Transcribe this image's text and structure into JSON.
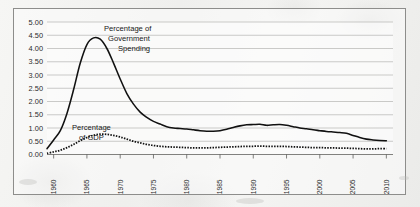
{
  "chart_data": {
    "type": "line",
    "title": "",
    "subtitle": "",
    "xlabel": "",
    "ylabel": "",
    "xlim": [
      1959,
      2011
    ],
    "ylim": [
      0.0,
      5.0
    ],
    "grid": true,
    "legend_position": "inline-annotations",
    "y_ticks": [
      "5.00",
      "4.50",
      "4.00",
      "3.50",
      "3.00",
      "2.50",
      "2.00",
      "1.50",
      "1.00",
      "0.50",
      "0.00"
    ],
    "y_tick_values": [
      5.0,
      4.5,
      4.0,
      3.5,
      3.0,
      2.5,
      2.0,
      1.5,
      1.0,
      0.5,
      0.0
    ],
    "x_ticks": [
      "1960",
      "1965",
      "1970",
      "1975",
      "1980",
      "1985",
      "1990",
      "1995",
      "2000",
      "2005",
      "2010"
    ],
    "x_tick_values": [
      1960,
      1965,
      1970,
      1975,
      1980,
      1985,
      1990,
      1995,
      2000,
      2005,
      2010
    ],
    "annotations": [
      {
        "text": "Percentage of\nGovernment\nSpending",
        "lines": [
          "Percentage of",
          "Government",
          "Spending"
        ],
        "series": "Percentage of Government Spending"
      },
      {
        "text": "Percentage\nof GDP",
        "lines": [
          "Percentage",
          "of GDP"
        ],
        "series": "Percentage of GDP"
      }
    ],
    "series": [
      {
        "name": "Percentage of Government Spending",
        "style": "solid",
        "color": "#111111",
        "x": [
          1959,
          1960,
          1961,
          1962,
          1963,
          1964,
          1965,
          1966,
          1967,
          1968,
          1969,
          1970,
          1971,
          1972,
          1973,
          1974,
          1975,
          1976,
          1977,
          1978,
          1979,
          1980,
          1981,
          1982,
          1983,
          1984,
          1985,
          1986,
          1987,
          1988,
          1989,
          1990,
          1991,
          1992,
          1993,
          1994,
          1995,
          1996,
          1997,
          1998,
          1999,
          2000,
          2001,
          2002,
          2003,
          2004,
          2005,
          2006,
          2007,
          2008,
          2009,
          2010
        ],
        "values": [
          0.22,
          0.55,
          0.9,
          1.55,
          2.45,
          3.45,
          4.15,
          4.4,
          4.35,
          4.0,
          3.45,
          2.85,
          2.3,
          1.9,
          1.6,
          1.4,
          1.25,
          1.15,
          1.05,
          1.0,
          0.98,
          0.96,
          0.93,
          0.9,
          0.88,
          0.88,
          0.9,
          0.95,
          1.02,
          1.08,
          1.12,
          1.13,
          1.14,
          1.1,
          1.12,
          1.13,
          1.1,
          1.05,
          1.0,
          0.97,
          0.93,
          0.9,
          0.87,
          0.85,
          0.83,
          0.8,
          0.72,
          0.64,
          0.58,
          0.55,
          0.53,
          0.52
        ]
      },
      {
        "name": "Percentage of GDP",
        "style": "dotted",
        "color": "#111111",
        "x": [
          1959,
          1960,
          1961,
          1962,
          1963,
          1964,
          1965,
          1966,
          1967,
          1968,
          1969,
          1970,
          1971,
          1972,
          1973,
          1974,
          1975,
          1976,
          1977,
          1978,
          1979,
          1980,
          1981,
          1982,
          1983,
          1984,
          1985,
          1986,
          1987,
          1988,
          1989,
          1990,
          1991,
          1992,
          1993,
          1994,
          1995,
          1996,
          1997,
          1998,
          1999,
          2000,
          2001,
          2002,
          2003,
          2004,
          2005,
          2006,
          2007,
          2008,
          2009,
          2010
        ],
        "values": [
          0.04,
          0.1,
          0.16,
          0.26,
          0.38,
          0.52,
          0.64,
          0.73,
          0.77,
          0.76,
          0.72,
          0.66,
          0.58,
          0.5,
          0.44,
          0.38,
          0.34,
          0.31,
          0.29,
          0.28,
          0.27,
          0.26,
          0.25,
          0.25,
          0.25,
          0.26,
          0.27,
          0.28,
          0.29,
          0.3,
          0.31,
          0.31,
          0.32,
          0.31,
          0.31,
          0.31,
          0.3,
          0.29,
          0.28,
          0.27,
          0.26,
          0.26,
          0.25,
          0.25,
          0.24,
          0.24,
          0.23,
          0.22,
          0.21,
          0.21,
          0.22,
          0.22
        ]
      }
    ]
  }
}
